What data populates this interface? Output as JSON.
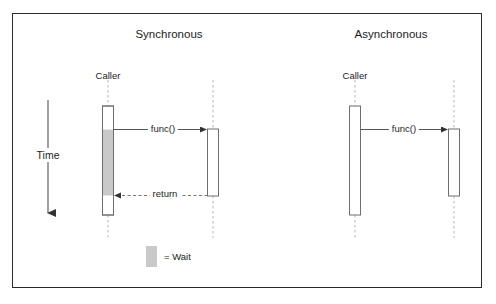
{
  "figure": {
    "border_color": "#2b2b2b",
    "background": "#ffffff"
  },
  "time_axis": {
    "label": "Time",
    "direction": "downward"
  },
  "legend": {
    "swatch_color": "#c9c9c9",
    "text": "= Wait"
  },
  "panels": [
    {
      "id": "synchronous",
      "title": "Synchronous",
      "caller_label": "Caller",
      "call_label": "func()",
      "return_label": "return",
      "has_return": true,
      "caller_has_wait": true
    },
    {
      "id": "asynchronous",
      "title": "Asynchronous",
      "caller_label": "Caller",
      "call_label": "func()",
      "return_label": "",
      "has_return": false,
      "caller_has_wait": false
    }
  ],
  "colors": {
    "line": "#555555",
    "dashed_lifeline": "#b9b9b9",
    "bar_stroke": "#6e6e6e",
    "bar_fill": "#ffffff",
    "wait_fill": "#c9c9c9",
    "text": "#1c1c1c"
  }
}
